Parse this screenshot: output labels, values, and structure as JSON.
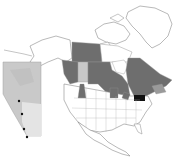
{
  "map": {
    "type": "choropleth-with-inset",
    "main_region": "North America",
    "colors": {
      "background": "#ffffff",
      "outline": "#9a9a9a",
      "shaded": "#6e6e6e",
      "highlight_light": "#c8c8c8",
      "highlight_dark": "#111111",
      "inset_fill": "#c9c9c9",
      "inset_light": "#e6e6e6",
      "dot": "#111111"
    },
    "shaded_regions": [
      "Yukon",
      "Northwest Territories",
      "British Columbia",
      "Saskatchewan",
      "Manitoba",
      "Ontario",
      "Quebec",
      "Labrador",
      "New Brunswick",
      "Nova Scotia",
      "Idaho",
      "Minnesota",
      "Michigan"
    ],
    "light_regions": [
      "Alberta"
    ],
    "dark_regions": [
      "Pennsylvania"
    ],
    "inset": {
      "region": "Alberta",
      "dots": [
        {
          "x": 19,
          "y": 101
        },
        {
          "x": 22,
          "y": 114
        },
        {
          "x": 24,
          "y": 129
        },
        {
          "x": 27,
          "y": 137
        }
      ]
    }
  }
}
